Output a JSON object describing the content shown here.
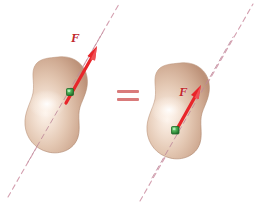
{
  "figure": {
    "background_color": "#ffffff",
    "width": 259,
    "height": 203
  },
  "labels": {
    "force_left": "F",
    "force_right": "F",
    "equals": "="
  },
  "colors": {
    "force_arrow": "#e8252a",
    "force_label": "#c1272d",
    "line_of_action": "#d4a0b0",
    "equals_sign": "#d97b7b",
    "body_fill_light": "#f0ddd0",
    "body_fill_mid": "#d9b9a4",
    "body_fill_dark": "#b99madd",
    "body_outline": "#a98772",
    "application_point": "#3fa34d",
    "application_point_outline": "#1f6b2a"
  },
  "panels": [
    {
      "name": "left-panel",
      "body": {
        "name": "rigid-body-left",
        "shape": "irregular-peanut-blob",
        "center_x": 60,
        "center_y": 103
      },
      "line_of_action": {
        "name": "line-of-action-left",
        "style": "dashed",
        "x1": 8,
        "y1": 197,
        "x2": 119,
        "y2": 4
      },
      "force_vector": {
        "name": "force-vector-left",
        "tail_x": 66,
        "tail_y": 102,
        "head_x": 97,
        "head_y": 47,
        "label": "F",
        "label_position": "left-of-arrow"
      },
      "application_point": {
        "name": "application-point-left",
        "x": 70,
        "y": 92,
        "shape": "square-dot",
        "color": "#3fa34d"
      }
    },
    {
      "name": "right-panel",
      "body": {
        "name": "rigid-body-right",
        "shape": "irregular-peanut-blob",
        "center_x": 182,
        "center_y": 110
      },
      "line_of_action": {
        "name": "line-of-action-right",
        "style": "dashed",
        "x1": 140,
        "y1": 201,
        "x2": 253,
        "y2": 4
      },
      "force_vector": {
        "name": "force-vector-right",
        "tail_x": 176,
        "tail_y": 129,
        "head_x": 200,
        "head_y": 87,
        "label": "F",
        "label_position": "left-of-arrow"
      },
      "application_point": {
        "name": "application-point-right",
        "x": 175,
        "y": 130,
        "shape": "square-dot",
        "color": "#3fa34d"
      }
    }
  ]
}
